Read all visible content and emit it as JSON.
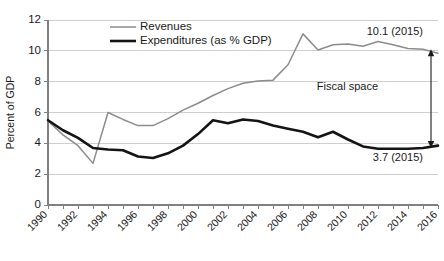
{
  "chart_data": {
    "type": "line",
    "title": "",
    "subtitle": "",
    "xlabel": "",
    "ylabel": "Percent of GDP",
    "ylim": [
      0,
      12
    ],
    "ytick_step": 2,
    "yticks": [
      "0",
      "2",
      "4",
      "6",
      "8",
      "10",
      "12"
    ],
    "xlim": [
      1990,
      2016
    ],
    "x": [
      1990,
      1991,
      1992,
      1993,
      1994,
      1995,
      1996,
      1997,
      1998,
      1999,
      2000,
      2001,
      2002,
      2003,
      2004,
      2005,
      2006,
      2007,
      2008,
      2009,
      2010,
      2011,
      2012,
      2013,
      2014,
      2015,
      2016
    ],
    "xticks": [
      "1990",
      "1992",
      "1994",
      "1996",
      "1998",
      "2000",
      "2002",
      "2004",
      "2006",
      "2008",
      "2010",
      "2012",
      "2014",
      "2016"
    ],
    "grid": true,
    "legend_position": "top-left-inside",
    "series": [
      {
        "name": "Revenues",
        "color": "#8c8c8c",
        "width": "thin",
        "values": [
          5.45,
          4.55,
          3.85,
          2.7,
          6.0,
          5.55,
          5.15,
          5.15,
          5.6,
          6.15,
          6.6,
          7.1,
          7.55,
          7.9,
          8.05,
          8.1,
          9.1,
          11.1,
          10.05,
          10.4,
          10.45,
          10.3,
          10.6,
          10.4,
          10.15,
          10.1,
          9.85
        ]
      },
      {
        "name": "Expenditures (as % GDP)",
        "color": "#141414",
        "width": "thick",
        "values": [
          5.5,
          4.85,
          4.35,
          3.7,
          3.6,
          3.55,
          3.15,
          3.05,
          3.35,
          3.85,
          4.6,
          5.5,
          5.3,
          5.55,
          5.45,
          5.15,
          4.95,
          4.75,
          4.4,
          4.75,
          4.25,
          3.8,
          3.65,
          3.65,
          3.65,
          3.7,
          3.85
        ]
      }
    ],
    "annotations": [
      {
        "name": "revenues-endpoint-label",
        "text": "10.1 (2015)",
        "x": 2015,
        "y": 11.0
      },
      {
        "name": "expenditures-endpoint-label",
        "text": "3.7 (2015)",
        "x": 2015,
        "y": 2.85
      },
      {
        "name": "fiscal-space-label",
        "text": "Fiscal space",
        "x": 2012,
        "y": 7.45
      }
    ],
    "gap_arrow": {
      "name": "fiscal-space-arrow",
      "top_value": 10.1,
      "bottom_value": 3.7,
      "at_x": 2015
    }
  }
}
